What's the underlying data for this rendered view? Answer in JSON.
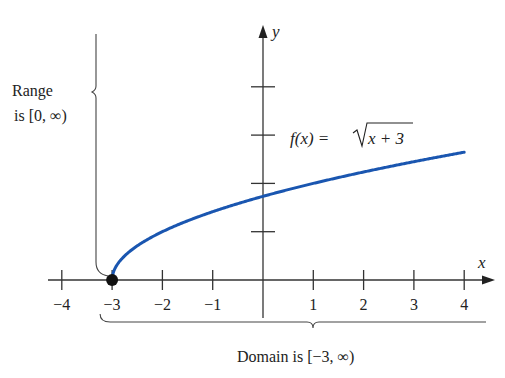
{
  "chart_data": {
    "type": "line",
    "title": "",
    "function_label": "f(x) = √(x + 3)",
    "function_label_parts": {
      "lhs": "f(x) =",
      "radicand": "x + 3"
    },
    "xlabel": "x",
    "ylabel": "y",
    "xlim": [
      -4.3,
      4.6
    ],
    "ylim": [
      0,
      5.4
    ],
    "x_ticks": [
      -4,
      -3,
      -2,
      -1,
      1,
      2,
      3,
      4
    ],
    "x_tick_labels": [
      "−4",
      "−3",
      "−2",
      "−1",
      "1",
      "2",
      "3",
      "4"
    ],
    "y_ticks": [
      1,
      2,
      3,
      4
    ],
    "y_tick_labels": [],
    "grid": false,
    "series": [
      {
        "name": "f(x) = √(x + 3)",
        "color": "#1a56b0",
        "x": [
          -3,
          -2.5,
          -2,
          -1.5,
          -1,
          -0.5,
          0,
          1,
          2,
          3,
          4
        ],
        "y": [
          0,
          0.707,
          1,
          1.225,
          1.414,
          1.581,
          1.732,
          2,
          2.236,
          2.449,
          2.646
        ]
      }
    ],
    "endpoint": {
      "x": -3,
      "y": 0,
      "style": "closed-dot"
    },
    "annotations": {
      "range_line1": "Range",
      "range_line2": "is [0, ∞)",
      "domain": "Domain is [−3, ∞)"
    }
  }
}
